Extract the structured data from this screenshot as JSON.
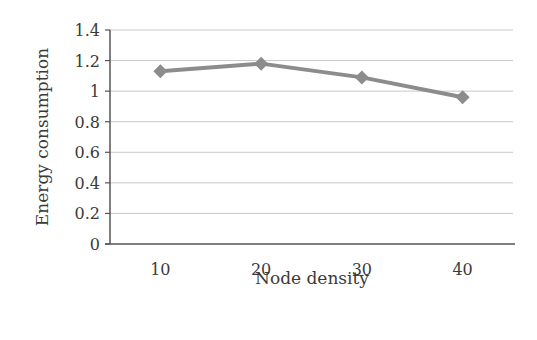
{
  "chart_data": {
    "type": "line",
    "title": "",
    "xlabel": "Node density",
    "ylabel": "Energy consumption",
    "categories": [
      "10",
      "20",
      "30",
      "40"
    ],
    "series": [
      {
        "name": "Energy consumption",
        "values": [
          1.13,
          1.18,
          1.09,
          0.96
        ],
        "marker": "diamond"
      }
    ],
    "ylim": [
      0,
      1.4
    ],
    "yticks": [
      0,
      0.2,
      0.4,
      0.6,
      0.8,
      1,
      1.2,
      1.4
    ],
    "ytick_labels": [
      "0",
      "0.2",
      "0.4",
      "0.6",
      "0.8",
      "1",
      "1.2",
      "1.4"
    ],
    "grid": true,
    "legend": null
  },
  "colors": {
    "series": "#8c8c8c",
    "grid": "#c8c8c8",
    "axis": "#555555",
    "text": "#3a3a3a"
  }
}
